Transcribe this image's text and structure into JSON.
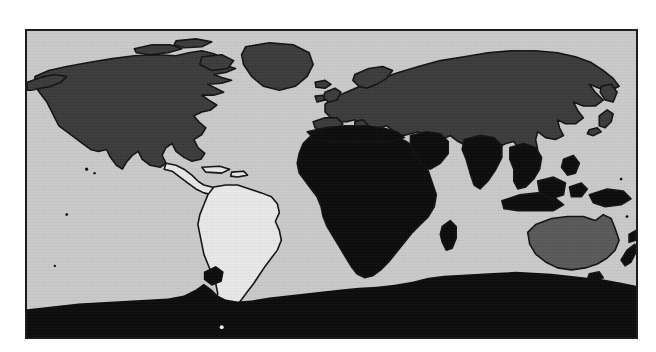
{
  "figure": {
    "type": "world-map",
    "projection": "equirectangular",
    "background_color": "#ffffff",
    "frame": {
      "border_color": "#1d1d1d",
      "border_width_px": 2,
      "x": 25,
      "y": 29,
      "width": 613,
      "height": 310
    }
  },
  "chart_data": {
    "type": "map",
    "title": "",
    "subtitle": "",
    "xlabel": "",
    "ylabel": "",
    "projection": "equirectangular",
    "lon_range": [
      -180,
      180
    ],
    "lat_range": [
      -90,
      84
    ],
    "grid": false,
    "legend": "none",
    "ocean_color": "#c9c9c9",
    "coastline_color": "#111111",
    "shade_levels": [
      {
        "name": "black",
        "color": "#0a0a0a"
      },
      {
        "name": "dark-gray",
        "color": "#3a3a3a"
      },
      {
        "name": "medium-gray",
        "color": "#585858"
      },
      {
        "name": "light-gray",
        "color": "#e8e8e8"
      }
    ],
    "regions": [
      {
        "name": "North America",
        "shade": "dark-gray",
        "color": "#3a3a3a"
      },
      {
        "name": "Greenland",
        "shade": "dark-gray",
        "color": "#3a3a3a"
      },
      {
        "name": "Europe",
        "shade": "dark-gray",
        "color": "#3a3a3a"
      },
      {
        "name": "Russia and Northern Asia",
        "shade": "dark-gray",
        "color": "#3a3a3a"
      },
      {
        "name": "China and East Asia",
        "shade": "dark-gray",
        "color": "#3a3a3a"
      },
      {
        "name": "Japan",
        "shade": "dark-gray",
        "color": "#3a3a3a"
      },
      {
        "name": "South America",
        "shade": "light-gray",
        "color": "#e8e8e8"
      },
      {
        "name": "Central America",
        "shade": "light-gray",
        "color": "#e8e8e8"
      },
      {
        "name": "Africa",
        "shade": "black",
        "color": "#0a0a0a"
      },
      {
        "name": "Madagascar",
        "shade": "black",
        "color": "#0a0a0a"
      },
      {
        "name": "Middle East",
        "shade": "black",
        "color": "#0a0a0a"
      },
      {
        "name": "India and South Asia",
        "shade": "black",
        "color": "#0a0a0a"
      },
      {
        "name": "Southeast Asia",
        "shade": "black",
        "color": "#0a0a0a"
      },
      {
        "name": "Indonesia",
        "shade": "black",
        "color": "#0a0a0a"
      },
      {
        "name": "Philippines",
        "shade": "black",
        "color": "#0a0a0a"
      },
      {
        "name": "New Guinea",
        "shade": "black",
        "color": "#0a0a0a"
      },
      {
        "name": "New Zealand",
        "shade": "black",
        "color": "#0a0a0a"
      },
      {
        "name": "Antarctica",
        "shade": "black",
        "color": "#0a0a0a"
      },
      {
        "name": "Australia",
        "shade": "medium-gray",
        "color": "#585858"
      },
      {
        "name": "Tierra del Fuego",
        "shade": "black",
        "color": "#0a0a0a"
      }
    ]
  }
}
